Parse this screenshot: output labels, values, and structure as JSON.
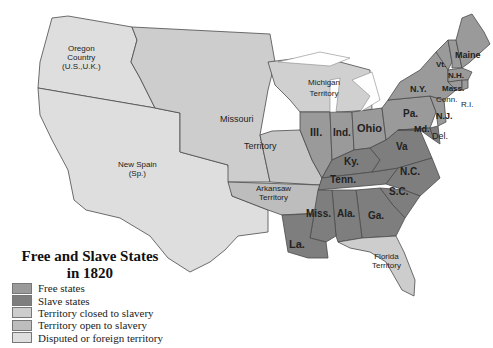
{
  "map": {
    "title_line1": "Free and Slave States",
    "title_line2": "in 1820",
    "colors": {
      "free": "#9a9a9a",
      "slave": "#808080",
      "closed": "#c8c8c8",
      "open": "#bcbcbc",
      "disputed": "#dcdcdc",
      "border": "#444444"
    },
    "legend": [
      {
        "label": "Free states",
        "color": "#9a9a9a"
      },
      {
        "label": "Slave states",
        "color": "#7e7e7e"
      },
      {
        "label": "Territory closed to slavery",
        "color": "#cdcdcd"
      },
      {
        "label": "Territory open to slavery",
        "color": "#bdbdbd"
      },
      {
        "label": "Disputed or foreign territory",
        "color": "#dedede"
      }
    ],
    "regions": {
      "oregon": {
        "l1": "Oregon",
        "l2": "Country",
        "l3": "(U.S.,U.K.)"
      },
      "new_spain": {
        "l1": "New Spain",
        "l2": "(Sp.)"
      },
      "missouri_territory": {
        "l1": "Missouri",
        "l2": "Territory"
      },
      "michigan": {
        "l1": "Michigan",
        "l2": "Territory"
      },
      "arkansaw": {
        "l1": "Arkansaw",
        "l2": "Territory"
      },
      "florida": {
        "l1": "Florida",
        "l2": "Territory"
      }
    },
    "states": {
      "ill": "Ill.",
      "ind": "Ind.",
      "ohio": "Ohio",
      "ky": "Ky.",
      "tenn": "Tenn.",
      "miss": "Miss.",
      "ala": "Ala.",
      "ga": "Ga.",
      "la": "La.",
      "sc": "S.C.",
      "nc": "N.C.",
      "va": "Va",
      "md": "Md.",
      "del": "Del.",
      "pa": "Pa.",
      "nj": "N.J.",
      "ny": "N.Y.",
      "vt": "Vt.",
      "nh": "N.H.",
      "maine": "Maine",
      "mass": "Mass.",
      "conn": "Conn.",
      "ri": "R.I."
    }
  }
}
